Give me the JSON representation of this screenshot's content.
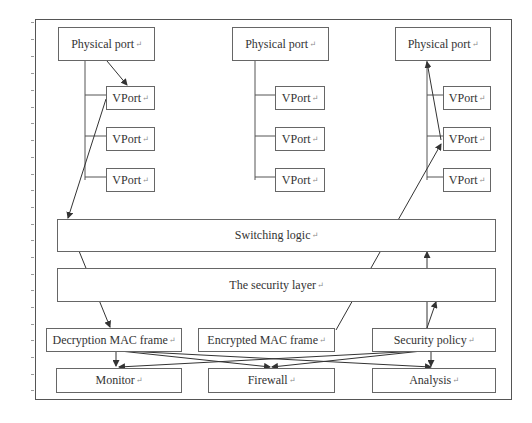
{
  "diagram": {
    "physical_ports": [
      {
        "label": "Physical port",
        "mark": "↵"
      },
      {
        "label": "Physical port",
        "mark": "↵"
      },
      {
        "label": "Physical port",
        "mark": "↵"
      }
    ],
    "vports": {
      "left": [
        {
          "label": "VPort",
          "mark": "↵"
        },
        {
          "label": "VPort",
          "mark": "↵"
        },
        {
          "label": "VPort",
          "mark": "↵"
        }
      ],
      "middle": [
        {
          "label": "VPort",
          "mark": "↵"
        },
        {
          "label": "VPort",
          "mark": "↵"
        },
        {
          "label": "VPort",
          "mark": "↵"
        }
      ],
      "right": [
        {
          "label": "VPort",
          "mark": "↵"
        },
        {
          "label": "VPort",
          "mark": "↵"
        },
        {
          "label": "VPort",
          "mark": "↵"
        }
      ]
    },
    "switching_logic": {
      "label": "Switching logic",
      "mark": "↵"
    },
    "security_layer": {
      "label": "The security layer",
      "mark": "↵"
    },
    "frames": {
      "decryption": {
        "label": "Decryption MAC frame",
        "mark": "↵"
      },
      "encrypted": {
        "label": "Encrypted MAC frame",
        "mark": "↵"
      },
      "policy": {
        "label": "Security policy",
        "mark": "↵"
      }
    },
    "outputs": {
      "monitor": {
        "label": "Monitor",
        "mark": "↵"
      },
      "firewall": {
        "label": "Firewall",
        "mark": "↵"
      },
      "analysis": {
        "label": "Analysis",
        "mark": "↵"
      }
    },
    "colors": {
      "line": "#444444",
      "border": "#666666",
      "text": "#333333"
    }
  }
}
